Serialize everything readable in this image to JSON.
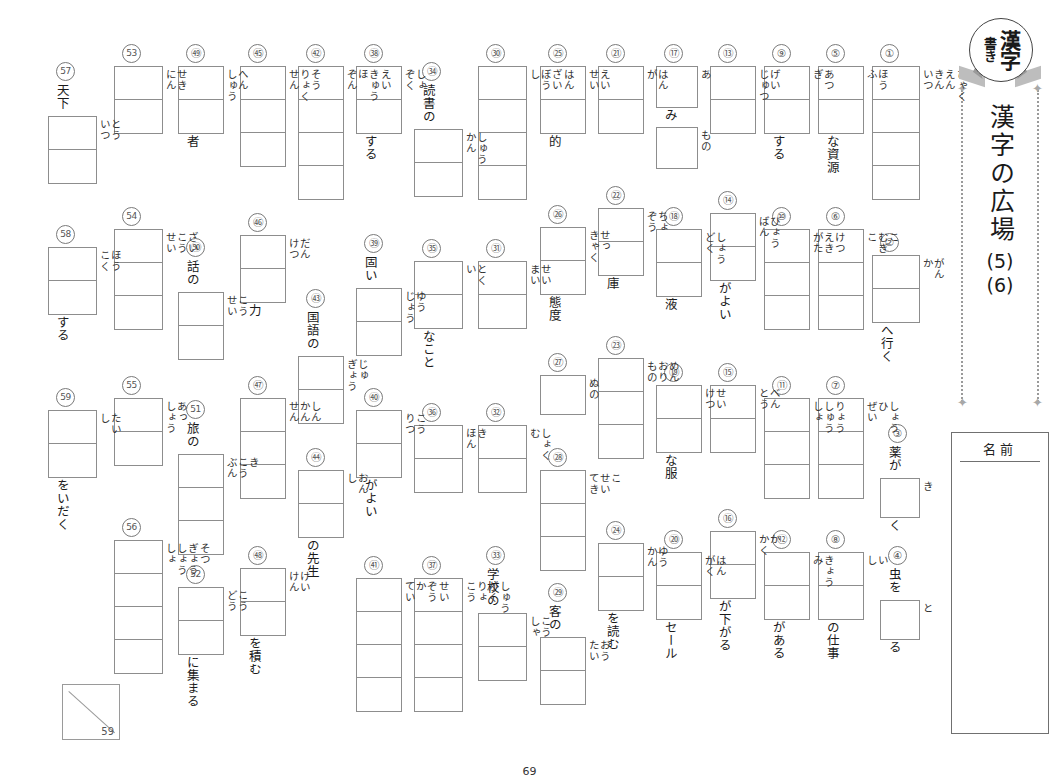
{
  "worksheet": {
    "badge": {
      "line_kanji": "漢字",
      "line_kaki": "書き"
    },
    "title": "漢字の広場",
    "sub1": "(5)",
    "sub2": "(6)",
    "name_label": "名前",
    "page_number": "69",
    "score_denominator": "59"
  },
  "items": [
    {
      "n": "①",
      "boxes": 4,
      "readings": [
        "ひゃく",
        "えん",
        "きん",
        "いつ"
      ],
      "pre": "",
      "post": ""
    },
    {
      "n": "②",
      "boxes": 2,
      "readings": [
        "がん",
        "か"
      ],
      "pre": "",
      "post": "へ行く"
    },
    {
      "n": "③",
      "boxes": 1,
      "readings": [
        "き"
      ],
      "pre": "薬が",
      "post": "く"
    },
    {
      "n": "④",
      "boxes": 1,
      "readings": [
        "と"
      ],
      "pre": "虫を",
      "post": "る"
    },
    {
      "n": "⑤",
      "boxes": 2,
      "readings": [
        "ほう",
        "ふ"
      ],
      "pre": "",
      "post": "な資源"
    },
    {
      "n": "⑥",
      "boxes": 3,
      "readings": [
        "こ",
        "むぎ",
        "こ"
      ],
      "pre": "",
      "post": ""
    },
    {
      "n": "⑦",
      "boxes": 3,
      "readings": [
        "しょう",
        "ひ",
        "ぜい"
      ],
      "pre": "",
      "post": ""
    },
    {
      "n": "⑧",
      "boxes": 2,
      "readings": [
        "い",
        "し"
      ],
      "pre": "",
      "post": "の仕事"
    },
    {
      "n": "⑨",
      "boxes": 2,
      "readings": [
        "あつ",
        "ぎ"
      ],
      "pre": "",
      "post": "する"
    },
    {
      "n": "⑩",
      "boxes": 3,
      "readings": [
        "けつ",
        "えき",
        "がた"
      ],
      "pre": "",
      "post": ""
    },
    {
      "n": "⑪",
      "boxes": 3,
      "readings": [
        "りょう",
        "しゅう",
        "しょ"
      ],
      "pre": "",
      "post": ""
    },
    {
      "n": "⑫",
      "boxes": 2,
      "readings": [
        "きょう",
        "み"
      ],
      "pre": "",
      "post": "がある"
    },
    {
      "n": "⑬",
      "boxes": 2,
      "readings": [
        "げい",
        "じゅつ"
      ],
      "pre": "",
      "post": ""
    },
    {
      "n": "⑭",
      "boxes": 2,
      "readings": [
        "ひょう",
        "ばん"
      ],
      "pre": "",
      "post": "がよい"
    },
    {
      "n": "⑮",
      "boxes": 2,
      "readings": [
        "べん",
        "とう"
      ],
      "pre": "",
      "post": ""
    },
    {
      "n": "⑯",
      "boxes": 2,
      "readings": [
        "か",
        "かく"
      ],
      "pre": "",
      "post": "が下がる"
    },
    {
      "n": "⑰",
      "boxes": 1,
      "readings": [
        "あ"
      ],
      "pre": "",
      "post": "み",
      "boxes2": 1,
      "readings2": [
        "もの"
      ]
    },
    {
      "n": "⑱",
      "boxes": 2,
      "readings": [
        "しょう",
        "どく"
      ],
      "pre": "",
      "post": "液"
    },
    {
      "n": "⑲",
      "boxes": 2,
      "readings": [
        "せい",
        "けつ"
      ],
      "pre": "",
      "post": "な服"
    },
    {
      "n": "⑳",
      "boxes": 2,
      "readings": [
        "はん",
        "がく"
      ],
      "pre": "",
      "post": "セール"
    },
    {
      "n": "㉑",
      "boxes": 2,
      "readings": [
        "はん",
        "が"
      ],
      "pre": "",
      "post": ""
    },
    {
      "n": "㉒",
      "boxes": 2,
      "readings": [
        "ちょ",
        "ぞう"
      ],
      "pre": "",
      "post": "庫"
    },
    {
      "n": "㉓",
      "boxes": 3,
      "readings": [
        "めん",
        "おり",
        "もの"
      ],
      "pre": "",
      "post": ""
    },
    {
      "n": "㉔",
      "boxes": 2,
      "readings": [
        "ゆう",
        "かん"
      ],
      "pre": "",
      "post": "を読む"
    },
    {
      "n": "㉕",
      "boxes": 2,
      "readings": [
        "えい",
        "せい"
      ],
      "pre": "",
      "post": "的"
    },
    {
      "n": "㉖",
      "boxes": 2,
      "readings": [
        "せっ",
        "きゃく"
      ],
      "pre": "",
      "post": "態度"
    },
    {
      "n": "㉗",
      "boxes": 1,
      "readings": [
        "ぬの"
      ],
      "pre": "",
      "post": ""
    },
    {
      "n": "㉘",
      "boxes": 3,
      "readings": [
        "こ",
        "せい",
        "てき"
      ],
      "pre": "",
      "post": ""
    },
    {
      "n": "㉙",
      "boxes": 2,
      "readings": [
        "おう",
        "たい"
      ],
      "pre": "客の",
      "post": ""
    },
    {
      "n": "㉚",
      "boxes": 4,
      "readings": [
        "はん",
        "ざい",
        "ぼう",
        "し"
      ],
      "pre": "",
      "post": ""
    },
    {
      "n": "㉛",
      "boxes": 2,
      "readings": [
        "せい",
        "まい"
      ],
      "pre": "",
      "post": ""
    },
    {
      "n": "㉜",
      "boxes": 2,
      "readings": [
        "しょく",
        "む"
      ],
      "pre": "",
      "post": ""
    },
    {
      "n": "㉝",
      "boxes": 2,
      "readings": [
        "こう",
        "しゃ"
      ],
      "pre": "学校の",
      "post": ""
    },
    {
      "n": "㉞",
      "boxes": 2,
      "readings": [
        "しゅう",
        "かん"
      ],
      "pre": "読書の",
      "post": ""
    },
    {
      "n": "㉟",
      "boxes": 2,
      "readings": [
        "とく",
        "い"
      ],
      "pre": "",
      "post": "なこと"
    },
    {
      "n": "㊱",
      "boxes": 2,
      "readings": [
        "き",
        "ほん"
      ],
      "pre": "",
      "post": ""
    },
    {
      "n": "㊲",
      "boxes": 4,
      "readings": [
        "しゅう",
        "がく",
        "りょ",
        "こう"
      ],
      "pre": "",
      "post": ""
    },
    {
      "n": "㊳",
      "boxes": 2,
      "readings": [
        "しょ",
        "ぞく"
      ],
      "pre": "",
      "post": "する"
    },
    {
      "n": "㊴",
      "boxes": 2,
      "readings": [
        "ゆう",
        "じょう"
      ],
      "pre": "固い",
      "post": ""
    },
    {
      "n": "㊵",
      "boxes": 2,
      "readings": [
        "こう",
        "りつ"
      ],
      "pre": "",
      "post": "がよい"
    },
    {
      "n": "㊶",
      "boxes": 4,
      "readings": [
        "せい",
        "ぞう",
        "か",
        "てい"
      ],
      "pre": "",
      "post": ""
    },
    {
      "n": "㊷",
      "boxes": 4,
      "readings": [
        "えい",
        "きゅう",
        "ほ",
        "ぞん"
      ],
      "pre": "",
      "post": ""
    },
    {
      "n": "㊸",
      "boxes": 2,
      "readings": [
        "じゅ",
        "ぎょう"
      ],
      "pre": "国語の",
      "post": ""
    },
    {
      "n": "㊹",
      "boxes": 2,
      "readings": [
        "おん",
        "し"
      ],
      "pre": "",
      "post": "の先生"
    },
    {
      "n": "㊺",
      "boxes": 3,
      "readings": [
        "そう",
        "りょく",
        "せん"
      ],
      "pre": "",
      "post": ""
    },
    {
      "n": "㊻",
      "boxes": 2,
      "readings": [
        "だん",
        "けつ"
      ],
      "pre": "",
      "post": "力"
    },
    {
      "n": "㊼",
      "boxes": 3,
      "readings": [
        "しん",
        "かん",
        "せん"
      ],
      "pre": "",
      "post": ""
    },
    {
      "n": "㊽",
      "boxes": 2,
      "readings": [
        "けい",
        "けん"
      ],
      "pre": "",
      "post": "を積む"
    },
    {
      "n": "㊾",
      "boxes": 2,
      "readings": [
        "へん",
        "しゅう"
      ],
      "pre": "",
      "post": "者"
    },
    {
      "n": "㊿",
      "boxes": 2,
      "readings": [
        "こう",
        "せい"
      ],
      "pre": "話の",
      "post": ""
    },
    {
      "n": "51",
      "boxes": 3,
      "readings": [
        "き",
        "こう",
        "ぶん"
      ],
      "pre": "旅の",
      "post": ""
    },
    {
      "n": "52",
      "boxes": 2,
      "readings": [
        "こう",
        "どう"
      ],
      "pre": "",
      "post": "に集まる"
    },
    {
      "n": "53",
      "boxes": 2,
      "readings": [
        "せき",
        "にん"
      ],
      "pre": "",
      "post": ""
    },
    {
      "n": "54",
      "boxes": 3,
      "readings": [
        "ざい",
        "こう",
        "せい"
      ],
      "pre": "",
      "post": ""
    },
    {
      "n": "55",
      "boxes": 2,
      "readings": [
        "あっ",
        "しょう"
      ],
      "pre": "",
      "post": ""
    },
    {
      "n": "56",
      "boxes": 4,
      "readings": [
        "そつ",
        "ぎょう",
        "しょう",
        "しょ"
      ],
      "pre": "",
      "post": ""
    },
    {
      "n": "57",
      "boxes": 2,
      "readings": [
        "とう",
        "いつ"
      ],
      "pre": "天下",
      "post": ""
    },
    {
      "n": "58",
      "boxes": 2,
      "readings": [
        "ほう",
        "こく"
      ],
      "pre": "",
      "post": "する"
    },
    {
      "n": "59",
      "boxes": 2,
      "readings": [
        "たい",
        "し"
      ],
      "pre": "",
      "post": "をいだく"
    }
  ],
  "layout": [
    {
      "x": 872,
      "y": 44,
      "bw": 46,
      "ch": 33
    },
    {
      "x": 872,
      "y": 233,
      "bw": 46,
      "ch": 33
    },
    {
      "x": 880,
      "y": 424,
      "bw": 38,
      "ch": 38
    },
    {
      "x": 880,
      "y": 546,
      "bw": 38,
      "ch": 38
    },
    {
      "x": 818,
      "y": 44,
      "bw": 44,
      "ch": 33
    },
    {
      "x": 818,
      "y": 207,
      "bw": 44,
      "ch": 33
    },
    {
      "x": 818,
      "y": 376,
      "bw": 44,
      "ch": 33
    },
    {
      "x": 818,
      "y": 530,
      "bw": 44,
      "ch": 33
    },
    {
      "x": 764,
      "y": 44,
      "bw": 44,
      "ch": 33
    },
    {
      "x": 764,
      "y": 207,
      "bw": 44,
      "ch": 33
    },
    {
      "x": 764,
      "y": 376,
      "bw": 44,
      "ch": 33
    },
    {
      "x": 764,
      "y": 530,
      "bw": 44,
      "ch": 33
    },
    {
      "x": 710,
      "y": 44,
      "bw": 44,
      "ch": 33
    },
    {
      "x": 710,
      "y": 191,
      "bw": 44,
      "ch": 33
    },
    {
      "x": 710,
      "y": 363,
      "bw": 44,
      "ch": 33
    },
    {
      "x": 710,
      "y": 509,
      "bw": 44,
      "ch": 33
    },
    {
      "x": 656,
      "y": 44,
      "bw": 40,
      "ch": 40
    },
    {
      "x": 656,
      "y": 207,
      "bw": 44,
      "ch": 33
    },
    {
      "x": 656,
      "y": 363,
      "bw": 44,
      "ch": 33
    },
    {
      "x": 656,
      "y": 530,
      "bw": 44,
      "ch": 33
    },
    {
      "x": 598,
      "y": 44,
      "bw": 44,
      "ch": 33
    },
    {
      "x": 598,
      "y": 186,
      "bw": 44,
      "ch": 33
    },
    {
      "x": 598,
      "y": 336,
      "bw": 44,
      "ch": 33
    },
    {
      "x": 598,
      "y": 521,
      "bw": 44,
      "ch": 33
    },
    {
      "x": 540,
      "y": 44,
      "bw": 44,
      "ch": 33
    },
    {
      "x": 540,
      "y": 205,
      "bw": 44,
      "ch": 33
    },
    {
      "x": 540,
      "y": 353,
      "bw": 44,
      "ch": 38
    },
    {
      "x": 540,
      "y": 448,
      "bw": 44,
      "ch": 33
    },
    {
      "x": 540,
      "y": 583,
      "bw": 44,
      "ch": 33
    },
    {
      "x": 478,
      "y": 44,
      "bw": 47,
      "ch": 33
    },
    {
      "x": 478,
      "y": 239,
      "bw": 47,
      "ch": 33
    },
    {
      "x": 478,
      "y": 403,
      "bw": 47,
      "ch": 33
    },
    {
      "x": 478,
      "y": 546,
      "bw": 47,
      "ch": 33
    },
    {
      "x": 414,
      "y": 62,
      "bw": 47,
      "ch": 33
    },
    {
      "x": 414,
      "y": 239,
      "bw": 47,
      "ch": 33
    },
    {
      "x": 414,
      "y": 403,
      "bw": 47,
      "ch": 33
    },
    {
      "x": 414,
      "y": 556,
      "bw": 47,
      "ch": 33
    },
    {
      "x": 356,
      "y": 44,
      "bw": 44,
      "ch": 33
    },
    {
      "x": 356,
      "y": 234,
      "bw": 44,
      "ch": 33
    },
    {
      "x": 356,
      "y": 388,
      "bw": 44,
      "ch": 33
    },
    {
      "x": 356,
      "y": 556,
      "bw": 44,
      "ch": 33
    },
    {
      "x": 298,
      "y": 44,
      "bw": 44,
      "ch": 33
    },
    {
      "x": 298,
      "y": 289,
      "bw": 44,
      "ch": 33
    },
    {
      "x": 298,
      "y": 448,
      "bw": 44,
      "ch": 33
    },
    {
      "x": 240,
      "y": 44,
      "bw": 44,
      "ch": 33
    },
    {
      "x": 240,
      "y": 213,
      "bw": 44,
      "ch": 33
    },
    {
      "x": 240,
      "y": 376,
      "bw": 44,
      "ch": 33
    },
    {
      "x": 240,
      "y": 546,
      "bw": 44,
      "ch": 33
    },
    {
      "x": 178,
      "y": 44,
      "bw": 44,
      "ch": 33
    },
    {
      "x": 178,
      "y": 238,
      "bw": 44,
      "ch": 33
    },
    {
      "x": 178,
      "y": 400,
      "bw": 44,
      "ch": 33
    },
    {
      "x": 178,
      "y": 565,
      "bw": 44,
      "ch": 33
    },
    {
      "x": 114,
      "y": 44,
      "bw": 47,
      "ch": 33
    },
    {
      "x": 114,
      "y": 207,
      "bw": 47,
      "ch": 33
    },
    {
      "x": 114,
      "y": 376,
      "bw": 47,
      "ch": 33
    },
    {
      "x": 114,
      "y": 518,
      "bw": 47,
      "ch": 33
    },
    {
      "x": 48,
      "y": 62,
      "bw": 47,
      "ch": 33
    },
    {
      "x": 48,
      "y": 225,
      "bw": 47,
      "ch": 33
    },
    {
      "x": 48,
      "y": 388,
      "bw": 47,
      "ch": 33
    }
  ]
}
